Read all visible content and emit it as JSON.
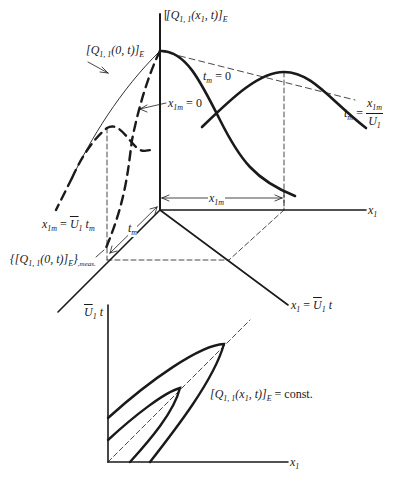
{
  "diagram": {
    "top_panel": {
      "vertical_axis_label": "[Q1,1(x1, t)]E",
      "vertical_axis_label_parts": {
        "base": "[Q",
        "sub": "1, 1",
        "mid": "(x",
        "sub2": "1",
        "tail": ", t)]",
        "sub3": "E"
      },
      "envelope_label": {
        "base": "[Q",
        "sub": "1, 1",
        "mid": "(0, t)]",
        "sub2": "E"
      },
      "curve_tm0_label": {
        "base": "t",
        "sub": "m",
        "tail": " = 0"
      },
      "curve_x1m0_label": {
        "base": "x",
        "sub": "1m",
        "tail": " = 0"
      },
      "curve_tm_label": {
        "base": "t",
        "sub": "m",
        "eq": " = ",
        "num": "x",
        "num_sub": "1m",
        "den": "U",
        "den_sub": "1"
      },
      "x1m_dimension_label": {
        "base": "x",
        "sub": "1m"
      },
      "x1_axis_label": {
        "base": "x",
        "sub": "1"
      },
      "diag_axis_label": {
        "base": "x",
        "sub": "1",
        "eq": " = ",
        "ubar": "U",
        "ubar_sub": "1",
        "tail": " t"
      },
      "x1m_eq_label": {
        "base": "x",
        "sub": "1m",
        "eq": " = ",
        "ubar": "U",
        "ubar_sub": "1",
        "tail": " t",
        "tail_sub": "m"
      },
      "tm_dimension_label": {
        "base": "t",
        "sub": "m"
      },
      "measured_label": {
        "open": "{[Q",
        "sub": "1, 1",
        "mid": "(0, t)]",
        "sub2": "E",
        "close": "}",
        "meas": ",meas."
      }
    },
    "bottom_panel": {
      "y_axis_label": {
        "ubar": "U",
        "sub": "1",
        "tail": " t"
      },
      "x_axis_label": {
        "base": "x",
        "sub": "1"
      },
      "contour_label": {
        "base": "[Q",
        "sub": "1, 1",
        "mid": "(x",
        "sub2": "1",
        "tail": ", t)]",
        "sub3": "E",
        "eq": " = const."
      }
    },
    "colors": {
      "ink": "#1a1a1a",
      "background": "#ffffff"
    }
  }
}
